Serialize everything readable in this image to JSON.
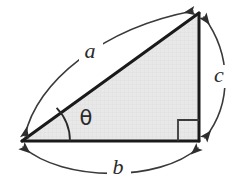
{
  "figure": {
    "type": "geometry-diagram",
    "background_color": "#ffffff",
    "width": 247,
    "height": 189
  },
  "labels": {
    "hypotenuse": "a",
    "base": "b",
    "vertical": "c",
    "angle": "θ"
  },
  "colors": {
    "triangle_fill": "#e6e6e6",
    "triangle_stroke": "#1a1a1a",
    "arc_stroke": "#3a3a3a",
    "right_angle_stroke": "#3a3a3a",
    "angle_arc_stroke": "#2a2a2a",
    "label_color": "#2a2a2a",
    "grid_texture": "#d8d8d8"
  },
  "geometry": {
    "vertices": {
      "left": {
        "x": 22,
        "y": 141
      },
      "apex": {
        "x": 199,
        "y": 13
      },
      "right": {
        "x": 199,
        "y": 141
      }
    },
    "right_angle_marker": {
      "x": 178,
      "y": 120,
      "size": 21
    },
    "angle_arc_radius": 48,
    "label_positions": {
      "hypotenuse": {
        "x": 90,
        "y": 52
      },
      "base": {
        "x": 118,
        "y": 168
      },
      "vertical": {
        "x": 219,
        "y": 76
      },
      "angle": {
        "x": 86,
        "y": 118
      }
    }
  }
}
